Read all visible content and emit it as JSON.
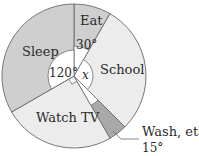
{
  "chart_data": {
    "type": "pie",
    "title": "",
    "unit": "degrees",
    "start_angle_deg": 0,
    "direction": "clockwise",
    "slices": [
      {
        "label": "Eat",
        "angle_label": "30°",
        "value": 30,
        "color": "#cfcfcf"
      },
      {
        "label": "School",
        "angle_label": "x",
        "value": 105,
        "color": "#ececec"
      },
      {
        "label": "Wash, etc",
        "angle_label": "15°",
        "value": 15,
        "color": "#a9a9a9"
      },
      {
        "label": "Watch TV",
        "angle_label": "90°",
        "value": 90,
        "color": "#ececec"
      },
      {
        "label": "Sleep",
        "angle_label": "120°",
        "value": 120,
        "color": "#cfcfcf"
      }
    ],
    "annotations": [
      "30°",
      "120°",
      "x",
      "15°",
      "right-angle marker (90°) on Watch TV"
    ]
  },
  "labels": {
    "eat": "Eat",
    "school": "School",
    "wash": "Wash, etc",
    "wash_angle": "15°",
    "watch_tv": "Watch TV",
    "sleep": "Sleep",
    "angle_eat": "30°",
    "angle_sleep": "120°",
    "angle_school": "x"
  },
  "style": {
    "stroke": "#6a6a6a",
    "inner_fill": "#ffffff"
  }
}
